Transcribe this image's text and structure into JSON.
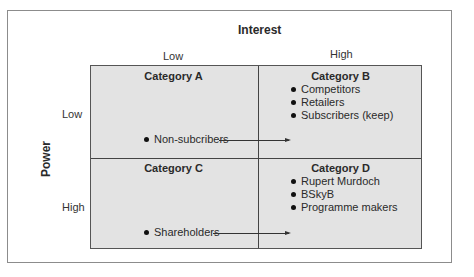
{
  "axes": {
    "x_title": "Interest",
    "x_low": "Low",
    "x_high": "High",
    "y_title": "Power",
    "y_low": "Low",
    "y_high": "High"
  },
  "quadrants": {
    "a": {
      "title": "Category A",
      "items": [
        "Non-subcribers"
      ]
    },
    "b": {
      "title": "Category B",
      "items": [
        "Competitors",
        "Retailers",
        "Subscribers (keep)"
      ]
    },
    "c": {
      "title": "Category C",
      "items": [
        "Shareholders"
      ]
    },
    "d": {
      "title": "Category D",
      "items": [
        "Rupert Murdoch",
        "BSkyB",
        "Programme makers"
      ]
    }
  },
  "colors": {
    "quadrant_fill": "#e3e3e3",
    "border": "#555555"
  }
}
